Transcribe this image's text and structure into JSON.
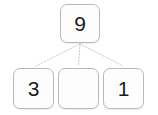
{
  "diagram": {
    "type": "number-bond-part-whole",
    "whole": {
      "label": "9",
      "is_empty": false
    },
    "parts": [
      {
        "label": "3",
        "is_empty": false
      },
      {
        "label": "",
        "is_empty": true
      },
      {
        "label": "1",
        "is_empty": false
      }
    ],
    "connector": {
      "style": "dotted",
      "color": "#c9c9c9",
      "count": 3
    },
    "colors": {
      "background": "#ffffff",
      "box_fill": "#fdfdfd",
      "box_border": "#b9b9b9",
      "text": "#1b1b1b"
    }
  }
}
